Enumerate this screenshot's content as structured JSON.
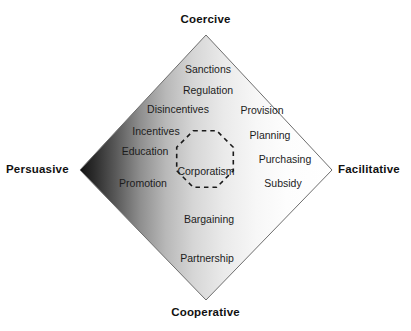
{
  "figure": {
    "background_color": "#ffffff"
  },
  "axes": {
    "top": {
      "label": "Coercive",
      "x": 206,
      "y": 20
    },
    "bottom": {
      "label": "Cooperative",
      "x": 206,
      "y": 312
    },
    "left": {
      "label": "Persuasive",
      "x": 40,
      "y": 170
    },
    "right": {
      "label": "Facilitative",
      "x": 368,
      "y": 170
    }
  },
  "diamond": {
    "top": {
      "x": 206,
      "y": 35
    },
    "right": {
      "x": 332,
      "y": 170
    },
    "bottom": {
      "x": 206,
      "y": 300
    },
    "left": {
      "x": 80,
      "y": 170
    },
    "outline_color": "#6e6e6e",
    "gradient_dark": "#151515",
    "gradient_light": "#ffffff"
  },
  "core": {
    "label": "Corporatism",
    "x": 206,
    "y": 171,
    "shape": "octagon",
    "border_style": "dashed",
    "border_color": "#1a1a1a",
    "center_x": 205,
    "center_y": 168,
    "radius": 40
  },
  "instruments": [
    {
      "label": "Sanctions",
      "x": 208,
      "y": 69
    },
    {
      "label": "Regulation",
      "x": 208,
      "y": 90
    },
    {
      "label": "Disincentives",
      "x": 178,
      "y": 109
    },
    {
      "label": "Incentives",
      "x": 156,
      "y": 131
    },
    {
      "label": "Education",
      "x": 145,
      "y": 151
    },
    {
      "label": "Promotion",
      "x": 143,
      "y": 183
    },
    {
      "label": "Provision",
      "x": 262,
      "y": 110
    },
    {
      "label": "Planning",
      "x": 270,
      "y": 135
    },
    {
      "label": "Purchasing",
      "x": 285,
      "y": 159
    },
    {
      "label": "Subsidy",
      "x": 283,
      "y": 183
    },
    {
      "label": "Bargaining",
      "x": 209,
      "y": 219
    },
    {
      "label": "Partnership",
      "x": 207,
      "y": 258
    }
  ]
}
